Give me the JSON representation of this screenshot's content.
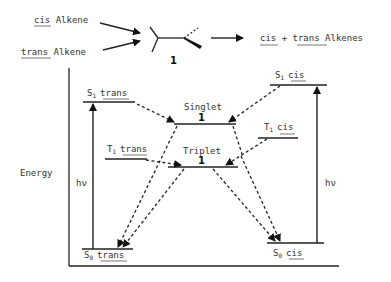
{
  "reaction": {
    "reactant_1": {
      "underlined": "cis",
      "rest": " Alkene"
    },
    "reactant_2": {
      "underlined": "trans",
      "rest": " Alkene"
    },
    "intermediate_label": "1",
    "product": {
      "part1": "cis",
      "plus": " + ",
      "part2": "trans",
      "rest": " Alkenes"
    }
  },
  "diagram": {
    "y_axis_label": "Energy",
    "levels": {
      "s1_trans": {
        "symbol": "S",
        "subscript": "1",
        "isomer": "trans"
      },
      "t1_trans": {
        "symbol": "T",
        "subscript": "1",
        "isomer": "trans"
      },
      "s0_trans": {
        "symbol": "S",
        "subscript": "0",
        "isomer": "trans"
      },
      "s1_cis": {
        "symbol": "S",
        "subscript": "1",
        "isomer": "cis"
      },
      "t1_cis": {
        "symbol": "T",
        "subscript": "1",
        "isomer": "cis"
      },
      "s0_cis": {
        "symbol": "S",
        "subscript": "0",
        "isomer": "cis"
      },
      "singlet": {
        "label": "Singlet",
        "number": "1"
      },
      "triplet": {
        "label": "Triplet",
        "number": "1"
      }
    },
    "excitation_left": "hν",
    "excitation_right": "hν"
  }
}
